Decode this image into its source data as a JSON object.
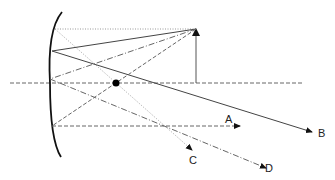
{
  "diagram": {
    "labels": {
      "A": "A",
      "B": "B",
      "C": "C",
      "D": "D"
    },
    "colors": {
      "mirror": "#111111",
      "ray_solid": "#444444",
      "ray_dashed": "#666666",
      "ray_dotted": "#999999",
      "axis": "#666666",
      "focal_point": "#000000"
    }
  }
}
